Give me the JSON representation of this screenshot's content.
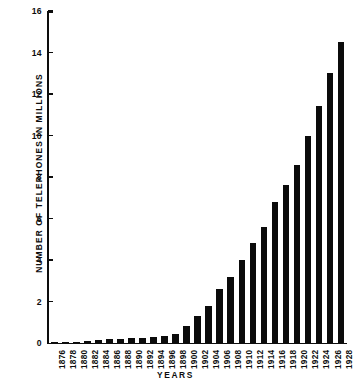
{
  "chart_data": {
    "type": "bar",
    "title": "",
    "xlabel": "YEARS",
    "ylabel": "NUMBER OF TELEPHONES IN MILLIONS",
    "ylim": [
      0,
      16
    ],
    "yticks": [
      0,
      2,
      4,
      6,
      8,
      10,
      12,
      14,
      16
    ],
    "ytick_labels": [
      "0",
      "2",
      "4",
      "6",
      "8",
      "10",
      "12",
      "14",
      "16"
    ],
    "grid": false,
    "legend": null,
    "categories": [
      "1876",
      "1878",
      "1880",
      "1882",
      "1884",
      "1886",
      "1888",
      "1890",
      "1892",
      "1894",
      "1896",
      "1898",
      "1900",
      "1902",
      "1904",
      "1906",
      "1908",
      "1910",
      "1912",
      "1914",
      "1916",
      "1918",
      "1920",
      "1922",
      "1924",
      "1926",
      "1928"
    ],
    "values": [
      0.01,
      0.06,
      0.06,
      0.1,
      0.14,
      0.17,
      0.18,
      0.24,
      0.26,
      0.29,
      0.33,
      0.42,
      0.8,
      1.3,
      1.8,
      2.6,
      3.2,
      4.0,
      4.8,
      5.6,
      6.8,
      7.6,
      8.6,
      10.0,
      11.4,
      13.0,
      14.5
    ],
    "bar_color": "#0b0b0b",
    "axis_color": "#0d0d0d",
    "background_color": "#ffffff"
  }
}
